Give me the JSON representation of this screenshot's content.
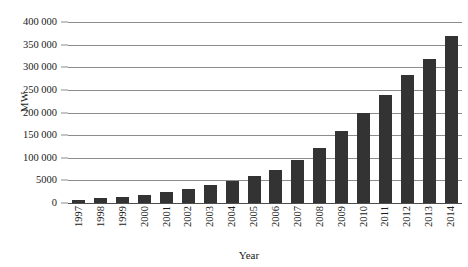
{
  "chart_data": {
    "type": "bar",
    "title": "",
    "xlabel": "Year",
    "ylabel": "MW",
    "categories": [
      "1997",
      "1998",
      "1999",
      "2000",
      "2001",
      "2002",
      "2003",
      "2004",
      "2005",
      "2006",
      "2007",
      "2008",
      "2009",
      "2010",
      "2011",
      "2012",
      "2013",
      "2014"
    ],
    "values": [
      7500,
      10200,
      13600,
      17400,
      23900,
      31100,
      39400,
      47600,
      59000,
      74000,
      94000,
      121000,
      159000,
      198000,
      238000,
      283000,
      318000,
      370000
    ],
    "ylim": [
      0,
      400000
    ],
    "y_ticks": [
      0,
      50000,
      100000,
      150000,
      200000,
      250000,
      300000,
      350000,
      400000
    ],
    "y_tick_labels": [
      "0",
      "5000",
      "100 000",
      "150 000",
      "200 000",
      "250 000",
      "300 000",
      "350 000",
      "400 000"
    ],
    "grid": true,
    "legend": "none",
    "series_color": "#333333",
    "gridline_color": "#8c8c8c"
  }
}
